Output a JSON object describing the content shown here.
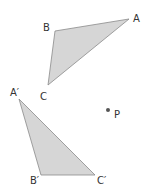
{
  "diagram": {
    "type": "geometric-rotation",
    "colors": {
      "fill": "#d6d6d6",
      "stroke": "#8a8a8a",
      "point": "#555555",
      "text": "#333333"
    },
    "triangle_original": {
      "vertices": [
        {
          "label": "A",
          "x": 129,
          "y": 19,
          "lx": 133,
          "ly": 22
        },
        {
          "label": "B",
          "x": 55,
          "y": 31,
          "lx": 43,
          "ly": 31
        },
        {
          "label": "C",
          "x": 48,
          "y": 85,
          "lx": 40,
          "ly": 100
        }
      ]
    },
    "triangle_image": {
      "vertices": [
        {
          "label": "A′",
          "x": 19,
          "y": 99,
          "lx": 10,
          "ly": 96
        },
        {
          "label": "B′",
          "x": 41,
          "y": 175,
          "lx": 30,
          "ly": 184
        },
        {
          "label": "C′",
          "x": 95,
          "y": 175,
          "lx": 97,
          "ly": 184
        }
      ]
    },
    "point": {
      "label": "P",
      "x": 108,
      "y": 110,
      "lx": 114,
      "ly": 118
    }
  }
}
